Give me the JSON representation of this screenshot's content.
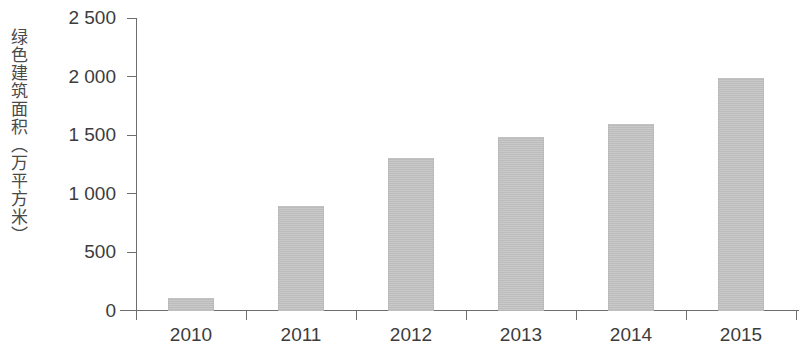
{
  "chart_data": {
    "type": "bar",
    "title": "",
    "subtitle": "",
    "xlabel": "",
    "ylabel": "绿色建筑面积（万平方米）",
    "categories": [
      "2010",
      "2011",
      "2012",
      "2013",
      "2014",
      "2015"
    ],
    "values": [
      110,
      890,
      1300,
      1480,
      1590,
      1990
    ],
    "series": [
      {
        "name": "绿色建筑面积",
        "values": [
          110,
          890,
          1300,
          1480,
          1590,
          1990
        ]
      }
    ],
    "ylim": [
      0,
      2500
    ],
    "ytick_values": [
      0,
      500,
      1000,
      1500,
      2000,
      2500
    ],
    "ytick_labels": [
      "0",
      "500",
      "1 000",
      "1 500",
      "2 000",
      "2 500"
    ],
    "xtick_labels": [
      "2010",
      "2011",
      "2012",
      "2013",
      "2014",
      "2015"
    ],
    "grid": false,
    "legend": false,
    "legend_position": "none",
    "bar_color": "#c3c3c3",
    "axis_color": "#6d6d6d",
    "text_color": "#3c3c3c"
  },
  "axes": {
    "y_title": "绿色建筑面积（万平方米）"
  }
}
